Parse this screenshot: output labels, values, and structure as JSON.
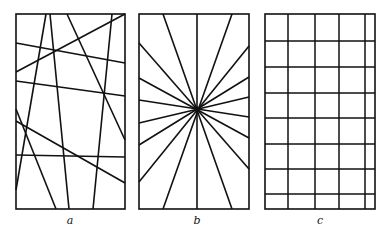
{
  "panels": [
    {
      "id": "a",
      "label": "a",
      "label_pos": [
        70,
        214
      ],
      "rect": [
        16,
        14,
        109,
        195
      ],
      "description": "random lines",
      "lines": [
        [
          46,
          14,
          16,
          190
        ],
        [
          50,
          14,
          69,
          209
        ],
        [
          67,
          14,
          125,
          140
        ],
        [
          112,
          14,
          93,
          209
        ],
        [
          125,
          14,
          16,
          72
        ],
        [
          16,
          43,
          125,
          63
        ],
        [
          16,
          81,
          125,
          96
        ],
        [
          16,
          109,
          56,
          209
        ],
        [
          16,
          121,
          125,
          183
        ],
        [
          16,
          155,
          125,
          157
        ]
      ]
    },
    {
      "id": "b",
      "label": "b",
      "label_pos": [
        197,
        214
      ],
      "rect": [
        139,
        14,
        110,
        195
      ],
      "description": "radiating lines through a common point",
      "center": [
        197,
        109
      ],
      "lines": [
        [
          197,
          14,
          197,
          209
        ],
        [
          163,
          14,
          232,
          209
        ],
        [
          232,
          14,
          163,
          209
        ],
        [
          139,
          43,
          249,
          169
        ],
        [
          139,
          78,
          249,
          138
        ],
        [
          139,
          100,
          249,
          117
        ],
        [
          139,
          123,
          249,
          97
        ],
        [
          139,
          145,
          249,
          77
        ],
        [
          139,
          182,
          249,
          46
        ]
      ]
    },
    {
      "id": "c",
      "label": "c",
      "label_pos": [
        320,
        214
      ],
      "rect": [
        265,
        14,
        110,
        195
      ],
      "description": "rectangular grid",
      "verticals": [
        288,
        315,
        339,
        365
      ],
      "horizontals": [
        41,
        67,
        93,
        118,
        144,
        169,
        194
      ]
    }
  ],
  "colors": {
    "stroke": "#111111",
    "background": "#ffffff"
  }
}
